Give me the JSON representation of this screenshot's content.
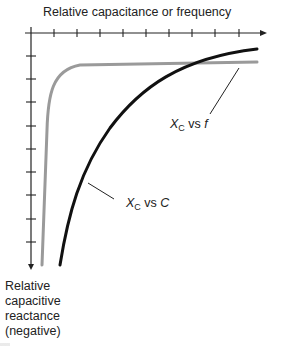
{
  "diagram": {
    "x_axis_label": "Relative capacitance or frequency",
    "y_axis_label_lines": [
      "Relative",
      "capacitive",
      "reactance",
      "(negative)"
    ],
    "curves": [
      {
        "name": "X_C vs f",
        "label_main": "X",
        "label_sub": "C",
        "label_rest": " vs ",
        "label_var": "f",
        "color": "#9a9a9a",
        "style": "gray, sharp knee near origin then flat"
      },
      {
        "name": "X_C vs C",
        "label_main": "X",
        "label_sub": "C",
        "label_rest": " vs ",
        "label_var": "C",
        "color": "#111111",
        "style": "black, gradual curve"
      }
    ],
    "x_ticks": 10,
    "y_ticks": 9,
    "colors": {
      "axis": "#222222",
      "gray_curve": "#9a9a9a",
      "black_curve": "#111111",
      "background": "#ffffff"
    }
  }
}
